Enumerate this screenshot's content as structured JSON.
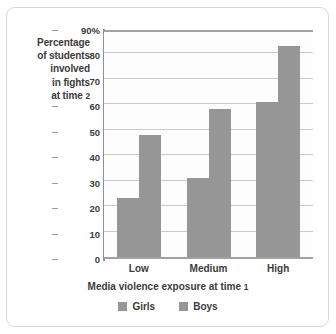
{
  "chart_data": {
    "type": "bar",
    "title": "",
    "subtitle": "",
    "categories": [
      "Low",
      "Medium",
      "High"
    ],
    "series": [
      {
        "name": "Girls",
        "values": [
          23,
          31,
          61
        ],
        "color": "#969696"
      },
      {
        "name": "Boys",
        "values": [
          48,
          58,
          83
        ],
        "color": "#969696"
      }
    ],
    "xlabel": "Media violence exposure at time 1",
    "xlabel_parts": {
      "text": "Media violence exposure at time ",
      "num": "1"
    },
    "ylabel": "Percentage of students involved in fights at time 2",
    "ylabel_lines": [
      "Percentage",
      "of students",
      "involved",
      "in fights",
      "at time "
    ],
    "ylabel_last_num": "2",
    "ylim": [
      0,
      90
    ],
    "yticks": [
      0,
      10,
      20,
      30,
      40,
      50,
      60,
      70,
      80,
      90
    ],
    "ytick_labels": [
      "0",
      "10",
      "20",
      "30",
      "40",
      "50",
      "60",
      "70",
      "80",
      "90%"
    ],
    "ytick_unit_suffix": "%",
    "grid": true,
    "grid_axis": "y",
    "legend_position": "bottom-center",
    "legend_entries": [
      "Girls",
      "Boys"
    ]
  },
  "colors": {
    "bar": "#969696",
    "grid": "#c9c9c9",
    "axis": "#9a9a9a",
    "text": "#3b3b3b",
    "frame": "#d8d8d8",
    "plot_bg": "#fdfdfd",
    "page_bg": "#ffffff"
  }
}
